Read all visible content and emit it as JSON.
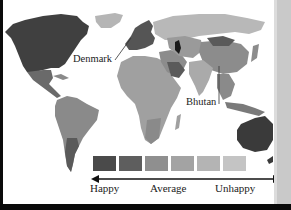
{
  "map": {
    "title": "World happiness map",
    "callouts": [
      {
        "label": "Denmark"
      },
      {
        "label": "Bhutan"
      }
    ],
    "legend": {
      "colors": [
        "#4a4a4a",
        "#5e5e5e",
        "#8f8f8f",
        "#a3a3a3",
        "#b4b4b4",
        "#c4c4c4"
      ],
      "labels": {
        "left": "Happy",
        "center": "Average",
        "right": "Unhappy"
      }
    },
    "region_shades": {
      "north_america": "#404040",
      "greenland": "#b5b5b5",
      "central_america": "#6a6a6a",
      "south_america": "#8a8a8a",
      "argentina": "#5a5a5a",
      "europe_west": "#555555",
      "africa": "#a0a0a0",
      "middle_east": "#8c8c8c",
      "saudi_arabia": "#5a5a5a",
      "russia": "#b8b8b8",
      "central_asia": "#9a9a9a",
      "china": "#8c8c8c",
      "mongolia": "#5a5a5a",
      "india": "#aaaaaa",
      "se_asia": "#8a8a8a",
      "australia": "#3a3a3a"
    }
  }
}
